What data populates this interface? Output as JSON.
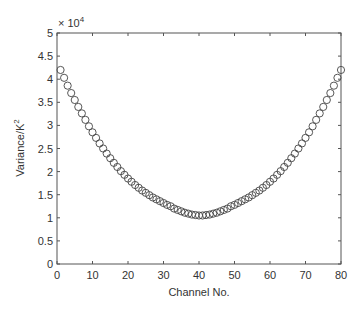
{
  "chart_data": {
    "type": "scatter",
    "title": "",
    "xlabel": "Channel No.",
    "ylabel": "Variance/K²",
    "ylabel_main": "Variance/K",
    "ylabel_sup": "2",
    "y_multiplier": "× 10",
    "y_multiplier_exp": "4",
    "xlim": [
      0,
      80
    ],
    "ylim": [
      0,
      5
    ],
    "x_ticks": [
      0,
      10,
      20,
      30,
      40,
      50,
      60,
      70,
      80
    ],
    "y_ticks": [
      0,
      0.5,
      1,
      1.5,
      2,
      2.5,
      3,
      3.5,
      4,
      4.5,
      5
    ],
    "y_tick_labels": [
      "0",
      "0.5",
      "1",
      "1.5",
      "2",
      "2.5",
      "3",
      "3.5",
      "4",
      "4.5",
      "5"
    ],
    "grid": false,
    "legend": null,
    "marker": "open-circle",
    "series": [
      {
        "name": "Variance",
        "x": [
          1,
          2,
          3,
          4,
          5,
          6,
          7,
          8,
          9,
          10,
          11,
          12,
          13,
          14,
          15,
          16,
          17,
          18,
          19,
          20,
          21,
          22,
          23,
          24,
          25,
          26,
          27,
          28,
          29,
          30,
          31,
          32,
          33,
          34,
          35,
          36,
          37,
          38,
          39,
          40,
          41,
          42,
          43,
          44,
          45,
          46,
          47,
          48,
          49,
          50,
          51,
          52,
          53,
          54,
          55,
          56,
          57,
          58,
          59,
          60,
          61,
          62,
          63,
          64,
          65,
          66,
          67,
          68,
          69,
          70,
          71,
          72,
          73,
          74,
          75,
          76,
          77,
          78,
          79,
          80
        ],
        "values": [
          4.2,
          4.03,
          3.86,
          3.7,
          3.55,
          3.4,
          3.26,
          3.12,
          2.98,
          2.85,
          2.73,
          2.61,
          2.5,
          2.39,
          2.29,
          2.19,
          2.1,
          2.01,
          1.93,
          1.85,
          1.78,
          1.71,
          1.65,
          1.59,
          1.54,
          1.49,
          1.44,
          1.4,
          1.36,
          1.32,
          1.28,
          1.25,
          1.2,
          1.17,
          1.14,
          1.11,
          1.09,
          1.07,
          1.06,
          1.05,
          1.05,
          1.06,
          1.07,
          1.09,
          1.11,
          1.14,
          1.17,
          1.2,
          1.25,
          1.28,
          1.32,
          1.36,
          1.4,
          1.44,
          1.49,
          1.54,
          1.59,
          1.65,
          1.71,
          1.78,
          1.85,
          1.93,
          2.01,
          2.1,
          2.19,
          2.29,
          2.39,
          2.5,
          2.61,
          2.73,
          2.85,
          2.98,
          3.12,
          3.26,
          3.4,
          3.55,
          3.7,
          3.86,
          4.03,
          4.2
        ]
      }
    ]
  },
  "colors": {
    "axis": "#555555",
    "marker": "#444444",
    "background": "#ffffff"
  }
}
